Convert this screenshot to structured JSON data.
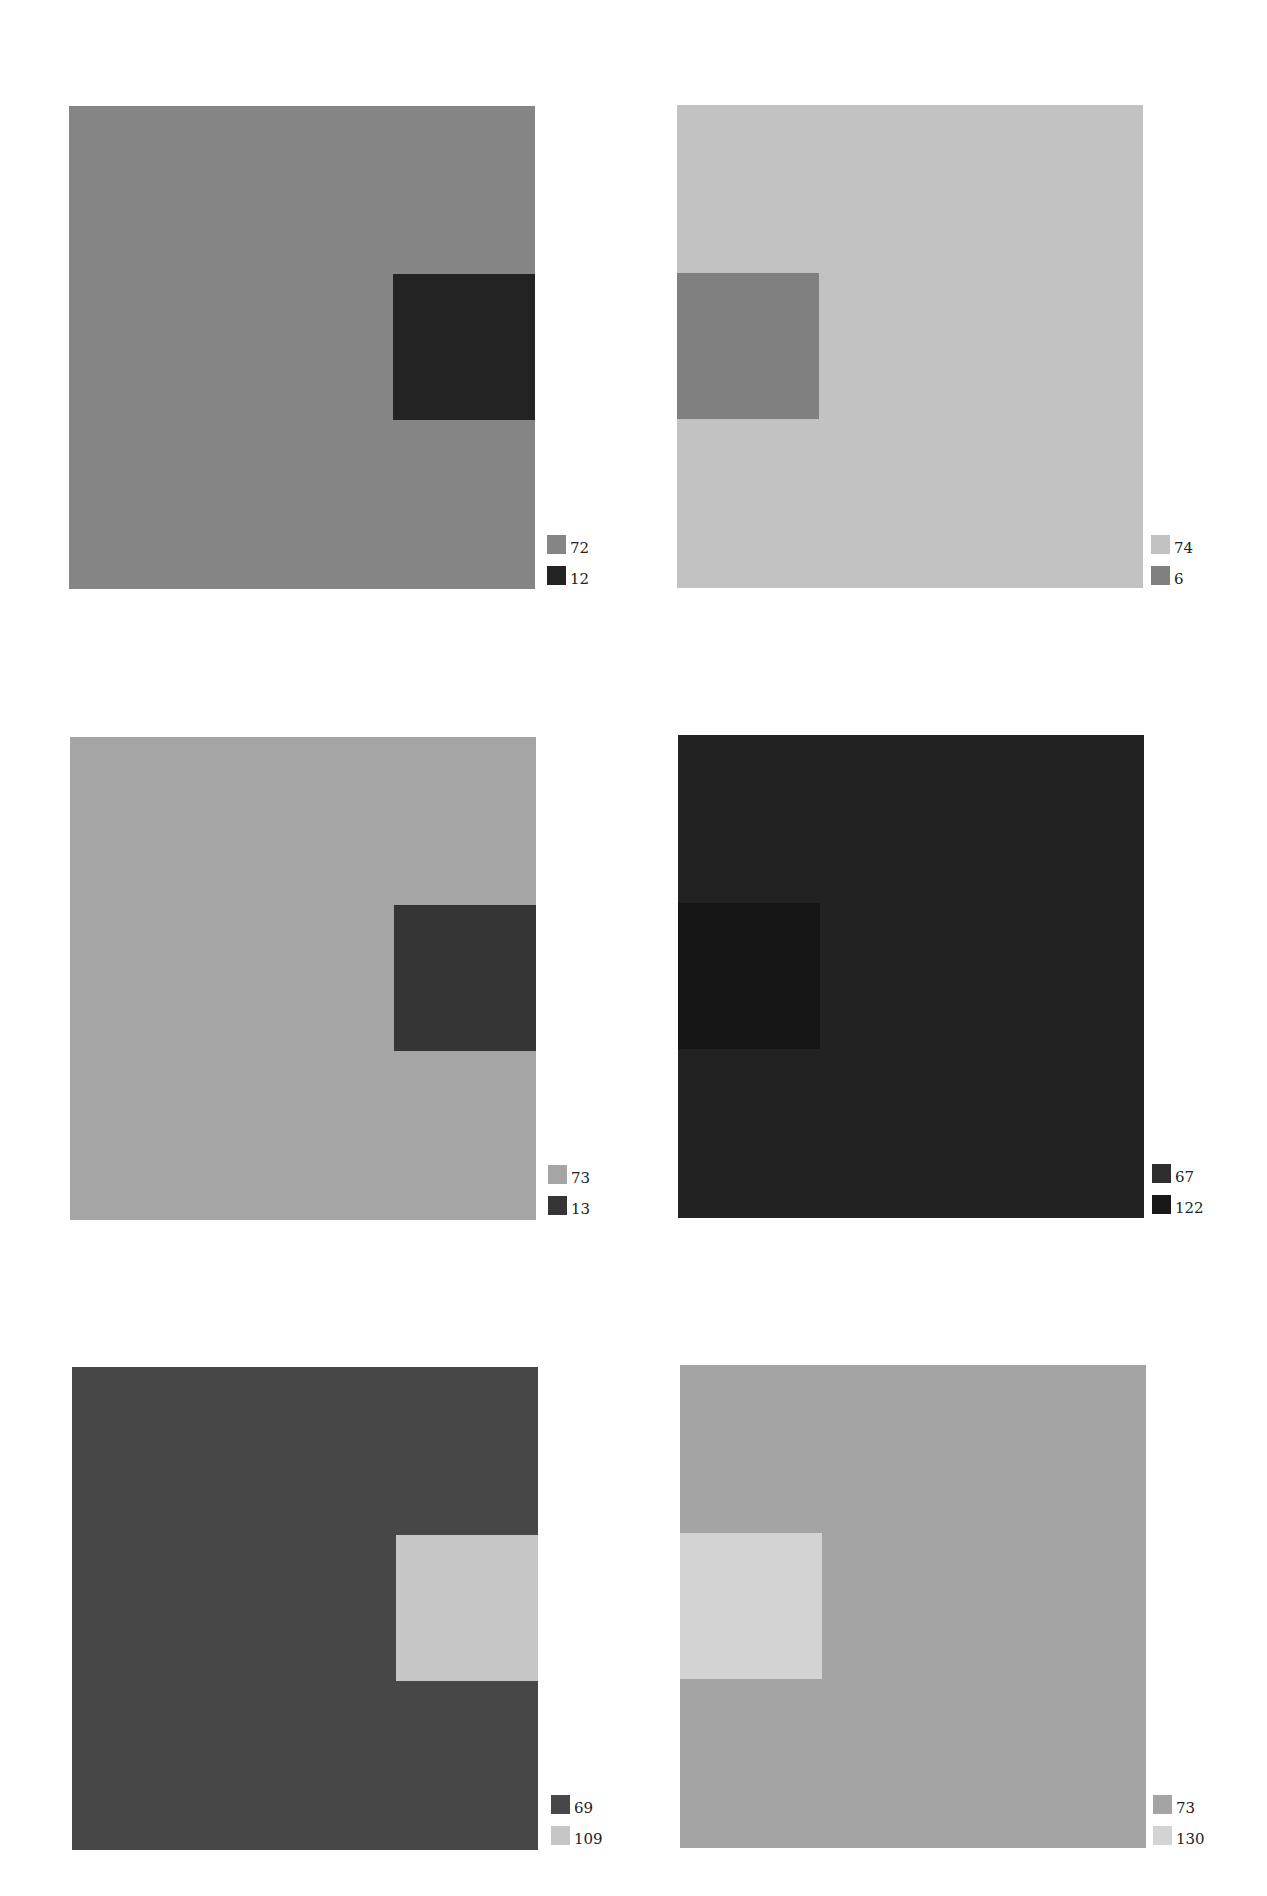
{
  "panels": [
    {
      "id": "p1",
      "outer_color": "#858585",
      "inner_color": "#232323",
      "inner_side": "right",
      "legend": [
        {
          "color": "#858585",
          "label": "72"
        },
        {
          "color": "#232323",
          "label": "12"
        }
      ]
    },
    {
      "id": "p2",
      "outer_color": "#c2c2c2",
      "inner_color": "#808080",
      "inner_side": "left",
      "legend": [
        {
          "color": "#c2c2c2",
          "label": "74"
        },
        {
          "color": "#808080",
          "label": "6"
        }
      ]
    },
    {
      "id": "p3",
      "outer_color": "#a5a5a5",
      "inner_color": "#353535",
      "inner_side": "right",
      "legend": [
        {
          "color": "#a5a5a5",
          "label": "73"
        },
        {
          "color": "#353535",
          "label": "13"
        }
      ]
    },
    {
      "id": "p4",
      "outer_color": "#222222",
      "inner_color": "#161616",
      "inner_side": "left",
      "legend": [
        {
          "color": "#2e2e2e",
          "label": "67"
        },
        {
          "color": "#181818",
          "label": "122"
        }
      ]
    },
    {
      "id": "p5",
      "outer_color": "#474747",
      "inner_color": "#c6c6c6",
      "inner_side": "right",
      "legend": [
        {
          "color": "#474747",
          "label": "69"
        },
        {
          "color": "#c6c6c6",
          "label": "109"
        }
      ]
    },
    {
      "id": "p6",
      "outer_color": "#a4a4a4",
      "inner_color": "#d3d3d3",
      "inner_side": "left",
      "legend": [
        {
          "color": "#a4a4a4",
          "label": "73"
        },
        {
          "color": "#d3d3d3",
          "label": "130"
        }
      ]
    }
  ]
}
